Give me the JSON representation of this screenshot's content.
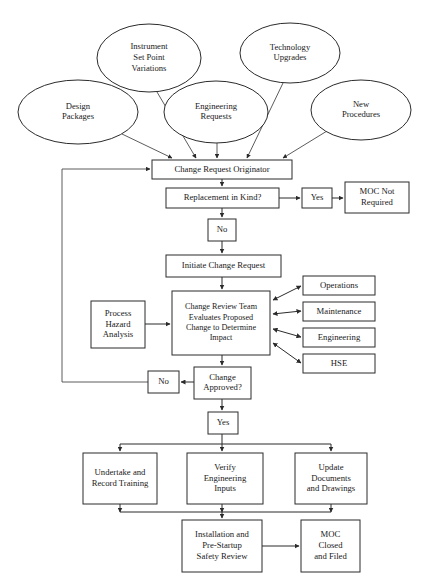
{
  "diagram": {
    "colors": {
      "background": "#ffffff",
      "stroke": "#2b2b2b",
      "text": "#1a1a1a",
      "shape_fill": "#ffffff"
    },
    "inputs": [
      {
        "id": "design-packages",
        "lines": [
          "Design",
          "Packages"
        ],
        "shape": "ellipse",
        "cx": 78,
        "cy": 112,
        "rx": 60,
        "ry": 32
      },
      {
        "id": "instrument-set-point-variations",
        "lines": [
          "Instrument",
          "Set Point",
          "Variations"
        ],
        "shape": "ellipse",
        "cx": 149,
        "cy": 58,
        "rx": 52,
        "ry": 34
      },
      {
        "id": "engineering-requests",
        "lines": [
          "Engineering",
          "Requests"
        ],
        "shape": "ellipse",
        "cx": 216,
        "cy": 112,
        "rx": 52,
        "ry": 31
      },
      {
        "id": "technology-upgrades",
        "lines": [
          "Technology",
          "Upgrades"
        ],
        "shape": "ellipse",
        "cx": 290,
        "cy": 53,
        "rx": 50,
        "ry": 30
      },
      {
        "id": "new-procedures",
        "lines": [
          "New",
          "Procedures"
        ],
        "shape": "ellipse",
        "cx": 361,
        "cy": 110,
        "rx": 50,
        "ry": 30
      }
    ],
    "process_boxes": [
      {
        "id": "change-request-originator",
        "lines": [
          "Change Request Originator"
        ],
        "x": 152,
        "y": 160,
        "w": 140,
        "h": 19
      },
      {
        "id": "replacement-in-kind",
        "lines": [
          "Replacement in Kind?"
        ],
        "x": 166,
        "y": 188,
        "w": 113,
        "h": 20
      },
      {
        "id": "yes-replacement",
        "lines": [
          "Yes"
        ],
        "x": 302,
        "y": 188,
        "w": 30,
        "h": 20
      },
      {
        "id": "moc-not-required",
        "lines": [
          "MOC Not",
          "Required"
        ],
        "x": 345,
        "y": 182,
        "w": 64,
        "h": 31
      },
      {
        "id": "no-replacement",
        "lines": [
          "No"
        ],
        "x": 208,
        "y": 219,
        "w": 28,
        "h": 22
      },
      {
        "id": "initiate-change-request",
        "lines": [
          "Initiate Change Request"
        ],
        "x": 166,
        "y": 255,
        "w": 115,
        "h": 22
      },
      {
        "id": "process-hazard-analysis",
        "lines": [
          "Process",
          "Hazard",
          "Analysis"
        ],
        "x": 91,
        "y": 301,
        "w": 54,
        "h": 47
      },
      {
        "id": "change-review-team",
        "lines": [
          "Change Review Team",
          "Evaluates Proposed",
          "Change to Determine",
          "Impact"
        ],
        "x": 172,
        "y": 291,
        "w": 98,
        "h": 64
      },
      {
        "id": "operations",
        "lines": [
          "Operations"
        ],
        "x": 303,
        "y": 276,
        "w": 72,
        "h": 19
      },
      {
        "id": "maintenance",
        "lines": [
          "Maintenance"
        ],
        "x": 303,
        "y": 302,
        "w": 72,
        "h": 19
      },
      {
        "id": "engineering",
        "lines": [
          "Engineering"
        ],
        "x": 303,
        "y": 328,
        "w": 72,
        "h": 19
      },
      {
        "id": "hse",
        "lines": [
          "HSE"
        ],
        "x": 303,
        "y": 354,
        "w": 72,
        "h": 19
      },
      {
        "id": "change-approved",
        "lines": [
          "Change",
          "Approved?"
        ],
        "x": 194,
        "y": 367,
        "w": 57,
        "h": 32
      },
      {
        "id": "no-approved",
        "lines": [
          "No"
        ],
        "x": 148,
        "y": 371,
        "w": 31,
        "h": 22
      },
      {
        "id": "yes-approved",
        "lines": [
          "Yes"
        ],
        "x": 208,
        "y": 412,
        "w": 30,
        "h": 22
      },
      {
        "id": "undertake-and-record-training",
        "lines": [
          "Undertake and",
          "Record Training"
        ],
        "x": 83,
        "y": 453,
        "w": 74,
        "h": 51
      },
      {
        "id": "verify-engineering-inputs",
        "lines": [
          "Verify",
          "Engineering",
          "Inputs"
        ],
        "x": 187,
        "y": 453,
        "w": 76,
        "h": 51
      },
      {
        "id": "update-documents-and-drawings",
        "lines": [
          "Update",
          "Documents",
          "and Drawings"
        ],
        "x": 295,
        "y": 453,
        "w": 72,
        "h": 51
      },
      {
        "id": "installation-and-pre-startup-safety-review",
        "lines": [
          "Installation and",
          "Pre-Startup",
          "Safety Review"
        ],
        "x": 182,
        "y": 520,
        "w": 80,
        "h": 52
      },
      {
        "id": "moc-closed-and-filed",
        "lines": [
          "MOC",
          "Closed",
          "and Filed"
        ],
        "x": 301,
        "y": 520,
        "w": 59,
        "h": 52
      }
    ],
    "connector_labels": {
      "replacement_yes": "Yes",
      "replacement_no": "No",
      "approved_yes": "Yes",
      "approved_no": "No"
    }
  }
}
